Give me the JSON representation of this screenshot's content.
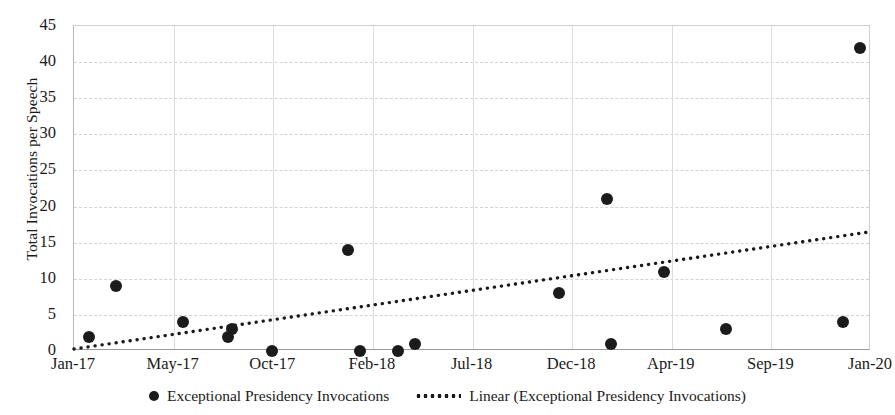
{
  "chart_data": {
    "type": "scatter",
    "title": "",
    "xlabel": "",
    "ylabel": "Total Invocations per Speech",
    "ylim": [
      0,
      45
    ],
    "yticks": [
      0,
      5,
      10,
      15,
      20,
      25,
      30,
      35,
      40,
      45
    ],
    "xticks": [
      "Jan-17",
      "May-17",
      "Oct-17",
      "Feb-18",
      "Jul-18",
      "Dec-18",
      "Apr-19",
      "Sep-19",
      "Jan-20"
    ],
    "grid": true,
    "legend_position": "bottom",
    "series": [
      {
        "name": "Exceptional Presidency Invocations",
        "type": "scatter",
        "marker": "filled-circle",
        "color": "#1b1b1b",
        "points": [
          {
            "x": 0.15,
            "y": 2
          },
          {
            "x": 0.42,
            "y": 9
          },
          {
            "x": 1.09,
            "y": 4
          },
          {
            "x": 1.55,
            "y": 2
          },
          {
            "x": 1.59,
            "y": 3
          },
          {
            "x": 1.99,
            "y": 0
          },
          {
            "x": 2.75,
            "y": 14
          },
          {
            "x": 2.87,
            "y": 0
          },
          {
            "x": 3.25,
            "y": 0
          },
          {
            "x": 3.42,
            "y": 1
          },
          {
            "x": 4.87,
            "y": 8
          },
          {
            "x": 5.35,
            "y": 21
          },
          {
            "x": 5.39,
            "y": 1
          },
          {
            "x": 5.92,
            "y": 11
          },
          {
            "x": 6.54,
            "y": 3
          },
          {
            "x": 7.72,
            "y": 4
          },
          {
            "x": 7.89,
            "y": 42
          }
        ]
      },
      {
        "name": "Linear (Exceptional Presidency Invocations)",
        "type": "line",
        "style": "dotted",
        "color": "#1b1b1b",
        "endpoints": [
          {
            "x": 0,
            "y": 0.0
          },
          {
            "x": 8,
            "y": 16.3
          }
        ]
      }
    ]
  },
  "legend": {
    "scatter_label": "Exceptional Presidency Invocations",
    "trend_label": "Linear (Exceptional Presidency Invocations)"
  },
  "axes": {
    "y_title": "Total Invocations per Speech"
  }
}
